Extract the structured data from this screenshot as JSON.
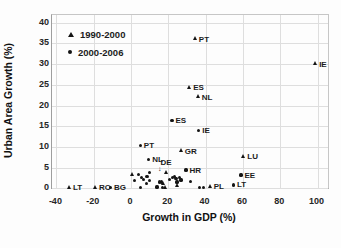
{
  "chart_data": {
    "type": "scatter",
    "title": "",
    "xlabel": "Growth in GDP (%)",
    "ylabel": "Urban Area Growth (%)",
    "xlim": [
      -44,
      104
    ],
    "ylim": [
      0,
      42
    ],
    "grid": true,
    "x_ticks": [
      -40,
      -20,
      0,
      20,
      40,
      60,
      80,
      100
    ],
    "y_ticks": [
      0,
      5,
      10,
      15,
      20,
      25,
      30,
      35,
      40
    ],
    "legend_position": "top-left-inside",
    "legend": [
      {
        "name": "1990-2000",
        "marker": "triangle"
      },
      {
        "name": "2000-2006",
        "marker": "dot"
      }
    ],
    "marker_color": "#141414",
    "series": [
      {
        "name": "1990-2000",
        "marker": "triangle",
        "points": [
          {
            "x": 34.5,
            "y": 36,
            "label": "PT"
          },
          {
            "x": 99,
            "y": 30,
            "label": "IE"
          },
          {
            "x": 31.5,
            "y": 24.3,
            "label": "ES"
          },
          {
            "x": 36,
            "y": 22,
            "label": "NL"
          },
          {
            "x": 27,
            "y": 9,
            "label": "GR"
          },
          {
            "x": 19,
            "y": 3.7,
            "label": "DE",
            "label_pos": "above"
          },
          {
            "x": 60.5,
            "y": 7.6,
            "label": "LU"
          },
          {
            "x": 42.5,
            "y": 0.4,
            "label": "PL"
          },
          {
            "x": -33,
            "y": 0.2,
            "label": "LT"
          },
          {
            "x": -19,
            "y": 0.2,
            "label": "RO"
          },
          {
            "x": 1,
            "y": 3.2
          },
          {
            "x": 17.5,
            "y": 1.0
          },
          {
            "x": 18.5,
            "y": 0.1
          },
          {
            "x": 24.7,
            "y": 0.6
          }
        ]
      },
      {
        "name": "2000-2006",
        "marker": "dot",
        "points": [
          {
            "x": 22,
            "y": 16.4,
            "label": "ES"
          },
          {
            "x": 36.3,
            "y": 14,
            "label": "IE"
          },
          {
            "x": 5,
            "y": 10.4,
            "label": "PT"
          },
          {
            "x": 9.5,
            "y": 6.9,
            "label": "NL"
          },
          {
            "x": 29.5,
            "y": 4.4,
            "label": "HR"
          },
          {
            "x": 59,
            "y": 3.2,
            "label": "EE"
          },
          {
            "x": 55,
            "y": 0.8,
            "label": "LT"
          },
          {
            "x": -11,
            "y": 0.2,
            "label": "BG"
          },
          {
            "x": 4,
            "y": 3.4
          },
          {
            "x": 5.5,
            "y": 2.7
          },
          {
            "x": 6.5,
            "y": 2.1
          },
          {
            "x": 2,
            "y": 1.8
          },
          {
            "x": 8.2,
            "y": 1.1
          },
          {
            "x": 5,
            "y": 0.1
          },
          {
            "x": 9.8,
            "y": 3.8
          },
          {
            "x": 8.6,
            "y": 2.8
          },
          {
            "x": 9.8,
            "y": 1.8
          },
          {
            "x": 13.9,
            "y": 0.3
          },
          {
            "x": 15.2,
            "y": 1.5
          },
          {
            "x": 16.5,
            "y": 1.5
          },
          {
            "x": 17,
            "y": 0.1
          },
          {
            "x": 20.5,
            "y": 2.2
          },
          {
            "x": 22.4,
            "y": 2.6
          },
          {
            "x": 23.3,
            "y": 2.9
          },
          {
            "x": 24.1,
            "y": 2.3
          },
          {
            "x": 25.9,
            "y": 2.6
          },
          {
            "x": 26.8,
            "y": 2.0
          },
          {
            "x": 24.7,
            "y": 1.5
          },
          {
            "x": 32,
            "y": 1.6
          },
          {
            "x": 36.6,
            "y": 0.2
          },
          {
            "x": 38.8,
            "y": 0.2
          }
        ]
      }
    ],
    "annotations": [
      {
        "text": "↓",
        "x": 15.5,
        "y": 5.0
      }
    ]
  },
  "colors": {
    "background": "#fdfdfd",
    "gridline": "#dedede",
    "axis": "#9e9e9e",
    "marker": "#141414",
    "text": "#1a1a1a"
  }
}
